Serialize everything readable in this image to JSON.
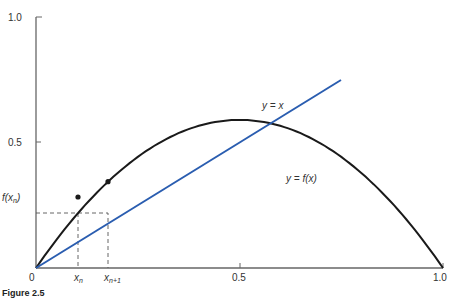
{
  "figure": {
    "caption": "Figure 2.5",
    "axes": {
      "y_ticks": [
        "1.0",
        "0.5"
      ],
      "x_ticks": [
        "0.5",
        "1.0"
      ],
      "origin": "0"
    },
    "labels": {
      "identity_line": "y = x",
      "curve": "y = f(x)",
      "fx_n": "f(xn)",
      "x_n": "xn",
      "x_n1": "xn+1"
    },
    "colors": {
      "identity_line": "#2a5db0",
      "curve": "#1a1a1a",
      "axes": "#666666",
      "dashed": "#555555"
    }
  },
  "chart_data": {
    "type": "line",
    "title": "",
    "xlabel": "",
    "ylabel": "",
    "xlim": [
      0,
      1.0
    ],
    "ylim": [
      0,
      1.0
    ],
    "x_ticks": [
      0,
      0.5,
      1.0
    ],
    "y_ticks": [
      0.5,
      1.0
    ],
    "grid": false,
    "series": [
      {
        "name": "y = x",
        "x": [
          0,
          0.75
        ],
        "y": [
          0,
          0.75
        ],
        "color": "#2a5db0"
      },
      {
        "name": "y = f(x)",
        "function": "f(x) ≈ 2.36·x·(1−x)",
        "x": [
          0,
          0.1,
          0.2,
          0.3,
          0.4,
          0.5,
          0.6,
          0.7,
          0.8,
          0.9,
          1.0
        ],
        "y": [
          0,
          0.21,
          0.38,
          0.5,
          0.57,
          0.59,
          0.57,
          0.5,
          0.38,
          0.21,
          0
        ],
        "color": "#1a1a1a"
      }
    ],
    "annotations": [
      {
        "label": "xn",
        "x": 0.103
      },
      {
        "label": "xn+1",
        "x": 0.177
      },
      {
        "label": "f(xn)",
        "y": 0.218
      },
      {
        "type": "points",
        "on": "y = f(x)",
        "x": [
          0.103,
          0.177
        ]
      },
      {
        "type": "dashed",
        "from": "(xn, f(xn))",
        "to": "(xn+1, f(xn))"
      }
    ]
  }
}
